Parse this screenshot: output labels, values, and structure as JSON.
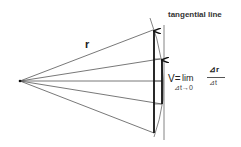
{
  "labels": {
    "tangential_line": "tangential line",
    "position_vector": "r",
    "velocity_prefix": "V=",
    "lim": "lim",
    "lim_subscript": "⊿t→0",
    "numerator": "⊿r",
    "denominator": "⊿t"
  },
  "geometry": {
    "origin": [
      20,
      81
    ],
    "ray_endpoints": [
      [
        153,
        30
      ],
      [
        160,
        59
      ],
      [
        162,
        81
      ],
      [
        162,
        104
      ],
      [
        154,
        133
      ]
    ],
    "long_arrow": {
      "from": [
        154,
        133
      ],
      "to": [
        154,
        30
      ]
    },
    "short_arrow": {
      "from": [
        162,
        104
      ],
      "to": [
        162,
        59
      ]
    },
    "tangent_line": {
      "x": 164,
      "y1": 25,
      "y2": 140
    }
  },
  "colors": {
    "line": "#555555",
    "arrow": "#111111",
    "background": "#ffffff"
  }
}
